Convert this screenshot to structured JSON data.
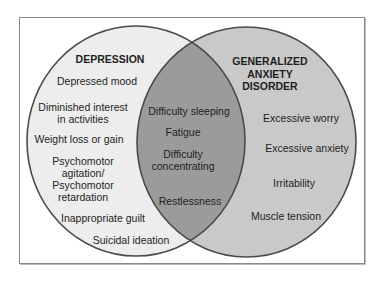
{
  "colors": {
    "left_fill": "#ededed",
    "right_fill": "#c9c9c9",
    "overlap_fill": "#9b9b9b",
    "outline": "#4a4a4a",
    "frame": "#8a8a8a"
  },
  "left_set": {
    "title": "DEPRESSION",
    "items": [
      "Depressed mood",
      "Diminished interest",
      "in activities",
      "Weight loss or gain",
      "Psychomotor",
      "agitation/",
      "Psychomotor",
      "retardation",
      "Inappropriate guilt",
      "Suicidal ideation"
    ]
  },
  "right_set": {
    "title_lines": [
      "GENERALIZED",
      "ANXIETY",
      "DISORDER"
    ],
    "items": [
      "Excessive worry",
      "Excessive anxiety",
      "Irritability",
      "Muscle tension"
    ]
  },
  "overlap": {
    "items": [
      "Difficulty sleeping",
      "Fatigue",
      "Difficulty",
      "concentrating",
      "Restlessness"
    ]
  }
}
